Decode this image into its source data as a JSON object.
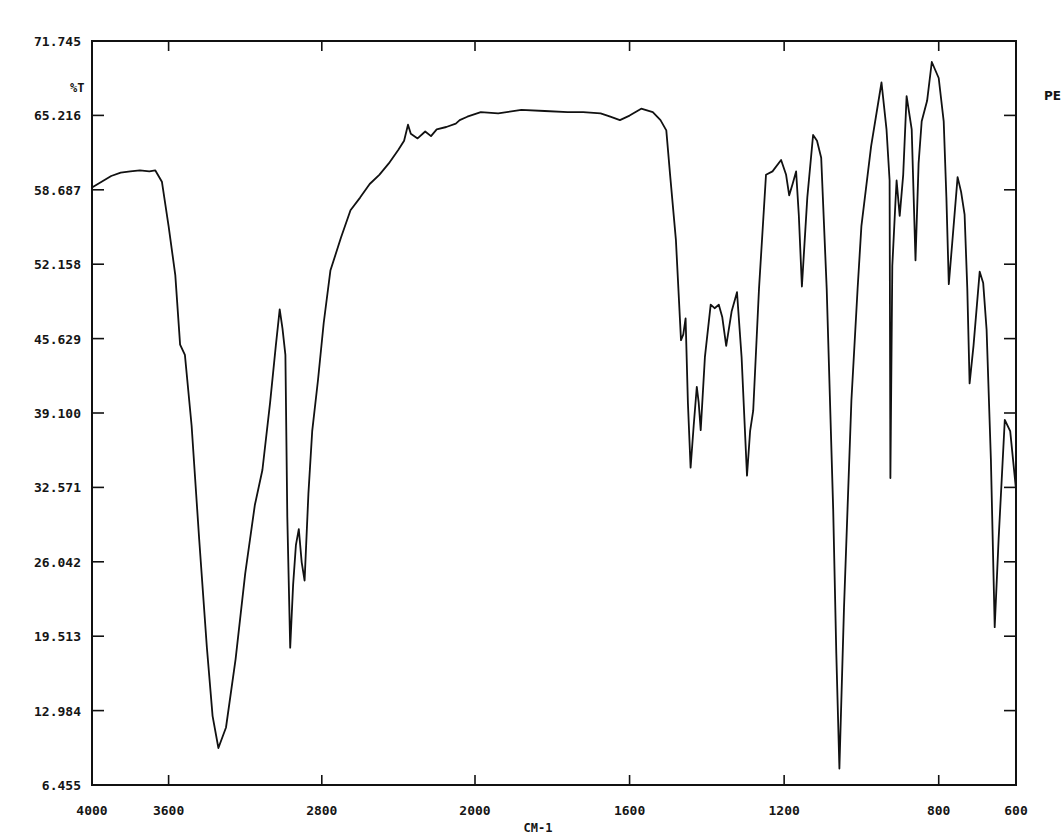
{
  "chart_data": {
    "type": "line",
    "title": "",
    "xlabel": "CM-1",
    "ylabel": "%T",
    "side_label": "PE",
    "xlim": [
      4000,
      600
    ],
    "ylim": [
      6.455,
      71.745
    ],
    "x_scale_break": 2000,
    "grid": false,
    "legend": "none",
    "x_ticks": [
      4000,
      3600,
      2800,
      2000,
      1600,
      1200,
      800,
      600
    ],
    "x_tick_labels": [
      "4000",
      "3600",
      "2800",
      "2000",
      "1600",
      "1200",
      "800",
      "600"
    ],
    "y_ticks": [
      6.455,
      12.984,
      19.513,
      26.042,
      32.571,
      39.1,
      45.629,
      52.158,
      58.687,
      65.216,
      71.745
    ],
    "y_tick_labels": [
      "6.455",
      "12.984",
      "19.513",
      "26.042",
      "32.571",
      "39.100",
      "45.629",
      "52.158",
      "58.687",
      "65.216",
      "71.745"
    ],
    "series": [
      {
        "name": "PE",
        "x": [
          4000,
          3950,
          3900,
          3850,
          3800,
          3750,
          3700,
          3670,
          3635,
          3600,
          3565,
          3540,
          3515,
          3480,
          3440,
          3400,
          3370,
          3340,
          3300,
          3250,
          3200,
          3150,
          3110,
          3070,
          3040,
          3020,
          3005,
          2990,
          2980,
          2965,
          2950,
          2935,
          2920,
          2905,
          2890,
          2870,
          2850,
          2820,
          2790,
          2755,
          2700,
          2650,
          2600,
          2550,
          2500,
          2450,
          2400,
          2370,
          2350,
          2335,
          2300,
          2260,
          2230,
          2200,
          2150,
          2100,
          2080,
          2040,
          1985,
          1940,
          1880,
          1820,
          1760,
          1720,
          1675,
          1650,
          1625,
          1600,
          1570,
          1540,
          1520,
          1505,
          1495,
          1480,
          1467,
          1461,
          1455,
          1449,
          1442,
          1434,
          1426,
          1421,
          1416,
          1405,
          1390,
          1380,
          1369,
          1360,
          1350,
          1336,
          1322,
          1310,
          1296,
          1288,
          1280,
          1265,
          1247,
          1230,
          1208,
          1195,
          1187,
          1178,
          1169,
          1162,
          1154,
          1140,
          1125,
          1115,
          1104,
          1090,
          1073,
          1065,
          1057,
          1045,
          1026,
          1010,
          1000,
          975,
          948,
          935,
          927,
          925,
          920,
          912,
          909,
          901,
          892,
          883,
          870,
          860,
          852,
          844,
          830,
          818,
          800,
          787,
          780,
          774,
          765,
          751,
          742,
          733,
          726,
          720,
          710,
          694,
          685,
          676,
          665,
          655,
          645,
          629,
          615,
          600
        ],
        "values": [
          58.9,
          59.4,
          59.9,
          60.2,
          60.3,
          60.4,
          60.3,
          60.4,
          59.4,
          55.5,
          51.2,
          45.1,
          44.2,
          38.0,
          28.0,
          18.5,
          12.5,
          9.7,
          11.5,
          17.5,
          25.0,
          31.0,
          34.1,
          40.0,
          45.0,
          48.2,
          46.5,
          44.2,
          30.0,
          18.5,
          24.0,
          27.5,
          28.9,
          26.0,
          24.4,
          32.0,
          37.5,
          42.0,
          47.0,
          51.6,
          54.5,
          56.9,
          58.0,
          59.2,
          60.0,
          61.0,
          62.2,
          63.0,
          64.4,
          63.6,
          63.2,
          63.8,
          63.4,
          64.0,
          64.2,
          64.5,
          64.8,
          65.1,
          65.5,
          65.4,
          65.7,
          65.6,
          65.5,
          65.5,
          65.4,
          65.1,
          64.8,
          65.2,
          65.8,
          65.5,
          64.8,
          63.9,
          60.0,
          54.3,
          45.5,
          46.0,
          47.4,
          40.0,
          34.3,
          38.0,
          41.4,
          40.0,
          37.6,
          44.0,
          48.6,
          48.3,
          48.6,
          47.5,
          45.0,
          48.0,
          49.7,
          44.0,
          33.6,
          37.5,
          39.3,
          50.0,
          60.0,
          60.3,
          61.3,
          60.0,
          58.2,
          59.2,
          60.3,
          56.5,
          50.2,
          58.0,
          63.5,
          63.0,
          61.5,
          50.0,
          30.6,
          18.0,
          7.9,
          22.0,
          40.2,
          50.0,
          55.5,
          62.5,
          68.1,
          64.0,
          59.5,
          33.4,
          52.0,
          57.5,
          59.5,
          56.4,
          60.0,
          66.9,
          64.0,
          52.5,
          61.0,
          64.7,
          66.5,
          69.9,
          68.5,
          64.7,
          58.0,
          50.4,
          54.0,
          59.8,
          58.5,
          56.5,
          50.0,
          41.7,
          45.0,
          51.5,
          50.5,
          46.4,
          35.0,
          20.3,
          28.0,
          38.5,
          37.5,
          32.4
        ]
      }
    ],
    "annotations": []
  }
}
